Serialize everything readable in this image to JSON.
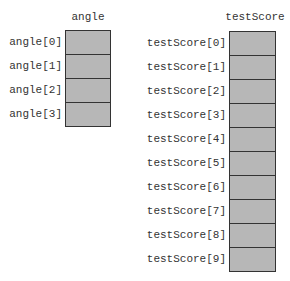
{
  "arrays": [
    {
      "name": "angle",
      "elements": [
        "angle[0]",
        "angle[1]",
        "angle[2]",
        "angle[3]"
      ]
    },
    {
      "name": "testScore",
      "elements": [
        "testScore[0]",
        "testScore[1]",
        "testScore[2]",
        "testScore[3]",
        "testScore[4]",
        "testScore[5]",
        "testScore[6]",
        "testScore[7]",
        "testScore[8]",
        "testScore[9]"
      ]
    }
  ],
  "colors": {
    "cell_fill": "#b7b7b7",
    "border": "#333333"
  }
}
